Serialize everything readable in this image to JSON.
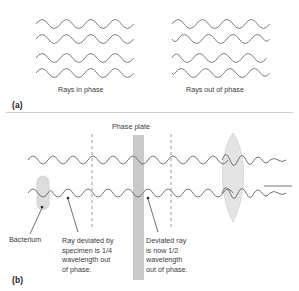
{
  "figure": {
    "title_a_letter": "(a)",
    "title_b_letter": "(b)",
    "colors": {
      "wave_stroke": "#6e6e6e",
      "shape_fill": "#d9d9d9",
      "plate_fill": "#c9c9c9",
      "lens_fill": "#e4e4e4",
      "text": "#3a3a3a",
      "dash": "#8c8c8c",
      "divider": "#cfcfcf"
    }
  },
  "panel_a": {
    "letter": "(a)",
    "left_label": "Rays in phase",
    "right_label": "Rays out of phase",
    "left_group": {
      "name": "in-phase-waves",
      "wave_count": 4,
      "phase_offsets_deg": [
        0,
        0,
        0,
        0
      ],
      "cycles": 4.5,
      "amplitude": 6.5
    },
    "right_group": {
      "name": "out-of-phase-waves",
      "wave_count": 4,
      "phase_offsets_deg": [
        0,
        150,
        40,
        190
      ],
      "cycles": 4.5,
      "amplitude": 6.5
    }
  },
  "panel_b": {
    "letter": "(b)",
    "phase_plate_label": "Phase plate",
    "annotations": [
      {
        "name": "bacterium",
        "text": "Bacterium"
      },
      {
        "name": "deviated-quarter",
        "lines": [
          "Ray deviated by",
          "specimen is 1/4",
          "wavelength out",
          "of phase."
        ]
      },
      {
        "name": "deviated-half",
        "lines": [
          "Deviated ray",
          "is now 1/2",
          "wavelength",
          "out of phase."
        ]
      }
    ],
    "elements": {
      "bacterium_shape": "capsule",
      "phase_plate_shape": "vertical-bar",
      "lens_shape": "vertical-lens",
      "dashed_line_count": 2,
      "wave_rows": 2,
      "output_ray": "flat-line"
    }
  }
}
